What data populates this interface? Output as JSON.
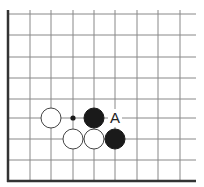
{
  "diagram": {
    "type": "go-board-corner",
    "grid": {
      "x_lines": [
        8,
        30,
        51,
        73,
        94,
        115,
        137,
        158,
        180
      ],
      "y_lines": [
        14,
        35,
        57,
        78,
        99,
        118,
        139,
        160
      ],
      "bottom_edge_y": 181,
      "left_edge_x": 8,
      "right_extent": 196,
      "top_extent": 10,
      "line_color": "#888888",
      "edge_color": "#333333"
    },
    "stones": [
      {
        "color": "white",
        "x": 51,
        "y": 118
      },
      {
        "color": "black",
        "x": 94,
        "y": 118
      },
      {
        "color": "white",
        "x": 73,
        "y": 139
      },
      {
        "color": "white",
        "x": 94,
        "y": 139
      },
      {
        "color": "black",
        "x": 115,
        "y": 139
      }
    ],
    "markers": [
      {
        "type": "dot",
        "x": 73,
        "y": 118
      }
    ],
    "labels": [
      {
        "text": "A",
        "x": 115,
        "y": 118
      }
    ],
    "stone_radius": 10
  }
}
